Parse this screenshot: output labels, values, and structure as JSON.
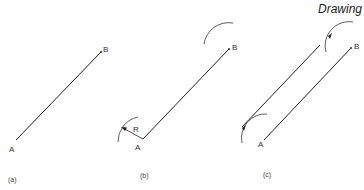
{
  "header": {
    "title": "Drawing"
  },
  "panels": [
    {
      "caption": "(a)",
      "point_a": "A",
      "point_b": "B"
    },
    {
      "caption": "(b)",
      "point_a": "A",
      "point_b": "B",
      "radius_label": "R"
    },
    {
      "caption": "(c)",
      "point_a": "A",
      "point_b": "B"
    }
  ],
  "colors": {
    "line": "#222222",
    "arc": "#333333",
    "text": "#333333"
  }
}
